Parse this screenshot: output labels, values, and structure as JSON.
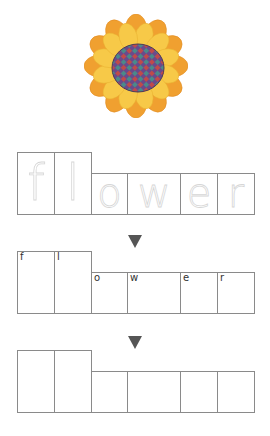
{
  "worksheet": {
    "word": "flower",
    "image": {
      "subject": "flower-icon",
      "colors": {
        "petals_outer": "#f0a030",
        "petals_inner": "#f7c948",
        "center_a": "#6b4a8a",
        "center_b": "#c04a4a",
        "center_c": "#4a8a8a"
      }
    },
    "rows": [
      {
        "name": "trace-row",
        "letters": [
          "f",
          "l",
          "o",
          "w",
          "e",
          "r"
        ],
        "style": "dotted-tracing"
      },
      {
        "name": "labeled-row",
        "letters": [
          "f",
          "l",
          "o",
          "w",
          "e",
          "r"
        ],
        "style": "corner-labels"
      },
      {
        "name": "blank-row",
        "letters": [
          "",
          "",
          "",
          "",
          "",
          ""
        ],
        "style": "empty"
      }
    ],
    "arrow_icon": "down-triangle-icon",
    "box_border_color": "#8a8a8a",
    "arrow_color": "#555555"
  }
}
